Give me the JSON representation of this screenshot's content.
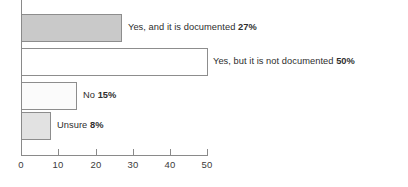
{
  "chart_data": {
    "type": "bar",
    "orientation": "horizontal",
    "title": "",
    "xlabel": "",
    "ylabel": "",
    "xlim": [
      0,
      50
    ],
    "xticks": [
      0,
      10,
      20,
      30,
      40,
      50
    ],
    "grid": false,
    "legend": false,
    "categories": [
      "Yes, and it is documented",
      "Yes, but it is not documented",
      "No",
      "Unsure"
    ],
    "values": [
      27,
      50,
      15,
      8
    ],
    "value_labels": [
      "27%",
      "50%",
      "15%",
      "8%"
    ],
    "bar_colors": [
      "#c9c9c9",
      "#ffffff",
      "#fbfbfb",
      "#e2e2e2"
    ],
    "bar_border_color": "#8d8d8d",
    "axis_color": "#8a8a8a",
    "text_color": "#2e2e2e"
  },
  "axis": {
    "tick_labels": [
      "0",
      "10",
      "20",
      "30",
      "40",
      "50"
    ]
  },
  "bars": [
    {
      "label": "Yes, and it is documented",
      "pct": "27%",
      "value": 27
    },
    {
      "label": "Yes, but it is not documented",
      "pct": "50%",
      "value": 50
    },
    {
      "label": "No",
      "pct": "15%",
      "value": 15
    },
    {
      "label": "Unsure",
      "pct": "8%",
      "value": 8
    }
  ]
}
